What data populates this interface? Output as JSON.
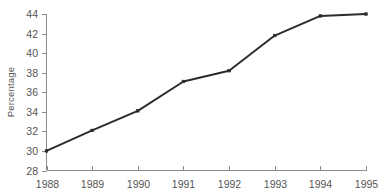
{
  "chart_data": {
    "type": "line",
    "title": "",
    "subtitle": "",
    "xlabel": "",
    "ylabel": "Percentage",
    "categories": [
      "1988",
      "1989",
      "1990",
      "1991",
      "1992",
      "1993",
      "1994",
      "1995"
    ],
    "x": [
      1988,
      1989,
      1990,
      1991,
      1992,
      1993,
      1994,
      1995
    ],
    "values": [
      30.0,
      32.1,
      34.1,
      37.1,
      38.2,
      41.8,
      43.8,
      44.0
    ],
    "series": [
      {
        "name": "Percentage",
        "values": [
          30.0,
          32.1,
          34.1,
          37.1,
          38.2,
          41.8,
          43.8,
          44.0
        ]
      }
    ],
    "ylim": [
      28,
      44
    ],
    "xlim": [
      1988,
      1995
    ],
    "yticks": [
      28,
      30,
      32,
      34,
      36,
      38,
      40,
      42,
      44
    ],
    "ytick_labels": [
      "28",
      "30",
      "32",
      "34",
      "36",
      "38",
      "40",
      "42",
      "44"
    ],
    "xticks": [
      1988,
      1989,
      1990,
      1991,
      1992,
      1993,
      1994,
      1995
    ],
    "xtick_labels": [
      "1988",
      "1989",
      "1990",
      "1991",
      "1992",
      "1993",
      "1994",
      "1995"
    ],
    "grid": false,
    "legend": false,
    "legend_position": "none",
    "marker": "square",
    "line_color": "#2b2b2b",
    "axis_color": "#8c8c8c",
    "background_color": "#ffffff",
    "annotations": []
  },
  "axis_titles": {
    "y": "Percentage"
  }
}
